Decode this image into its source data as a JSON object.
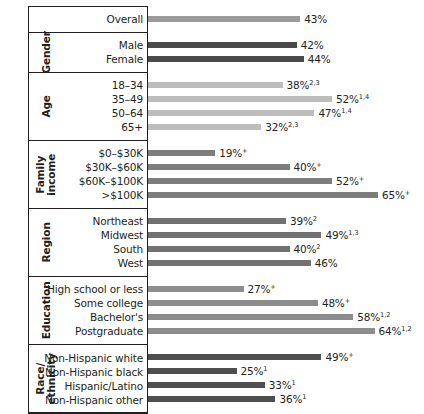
{
  "chart_data": {
    "type": "bar",
    "title": "",
    "xlabel": "",
    "ylabel": "",
    "orientation": "horizontal",
    "value_suffix": "%",
    "xlim": [
      0,
      65
    ],
    "grid": false,
    "legend": "none",
    "axis_tick_labels": [],
    "groups": [
      {
        "name": "",
        "shade": "s-overall",
        "color": "#9b9b9b",
        "categories": [
          "Overall"
        ],
        "values": [
          43
        ],
        "value_labels": [
          "43%"
        ],
        "superscripts": [
          ""
        ]
      },
      {
        "name": "Gender",
        "shade": "s-gender",
        "color": "#4a4a4a",
        "categories": [
          "Male",
          "Female"
        ],
        "values": [
          42,
          44
        ],
        "value_labels": [
          "42%",
          "44%"
        ],
        "superscripts": [
          "",
          ""
        ]
      },
      {
        "name": "Age",
        "shade": "s-age",
        "color": "#bdbdbd",
        "categories": [
          "18–34",
          "35–49",
          "50–64",
          "65+"
        ],
        "values": [
          38,
          52,
          47,
          32
        ],
        "value_labels": [
          "38%",
          "52%",
          "47%",
          "32%"
        ],
        "superscripts": [
          "2,3",
          "1,4",
          "1,4",
          "2,3"
        ]
      },
      {
        "name": "Family income",
        "shade": "s-income",
        "color": "#7d7d7d",
        "categories": [
          "$0–$30K",
          "$30K–$60K",
          "$60K–$100K",
          ">$100K"
        ],
        "values": [
          19,
          40,
          52,
          65
        ],
        "value_labels": [
          "19%",
          "40%",
          "52%",
          "65%"
        ],
        "superscripts": [
          "+",
          "+",
          "+",
          "+"
        ]
      },
      {
        "name": "Region",
        "shade": "s-region",
        "color": "#717171",
        "categories": [
          "Northeast",
          "Midwest",
          "South",
          "West"
        ],
        "values": [
          39,
          49,
          40,
          46
        ],
        "value_labels": [
          "39%",
          "49%",
          "40%",
          "46%"
        ],
        "superscripts": [
          "2",
          "1,3",
          "2",
          ""
        ]
      },
      {
        "name": "Education",
        "shade": "s-education",
        "color": "#8d8d8d",
        "categories": [
          "High school or less",
          "Some college",
          "Bachelor's",
          "Postgraduate"
        ],
        "values": [
          27,
          48,
          58,
          64
        ],
        "value_labels": [
          "27%",
          "48%",
          "58%",
          "64%"
        ],
        "superscripts": [
          "+",
          "+",
          "1,2",
          "1,2"
        ]
      },
      {
        "name": "Race/ ethnicity",
        "shade": "s-race",
        "color": "#4f4f4f",
        "categories": [
          "Non-Hispanic white",
          "Non-Hispanic black",
          "Hispanic/Latino",
          "Non-Hispanic other"
        ],
        "values": [
          49,
          25,
          33,
          36
        ],
        "value_labels": [
          "49%",
          "25%",
          "33%",
          "36%"
        ],
        "superscripts": [
          "+",
          "1",
          "1",
          "1"
        ]
      }
    ]
  }
}
